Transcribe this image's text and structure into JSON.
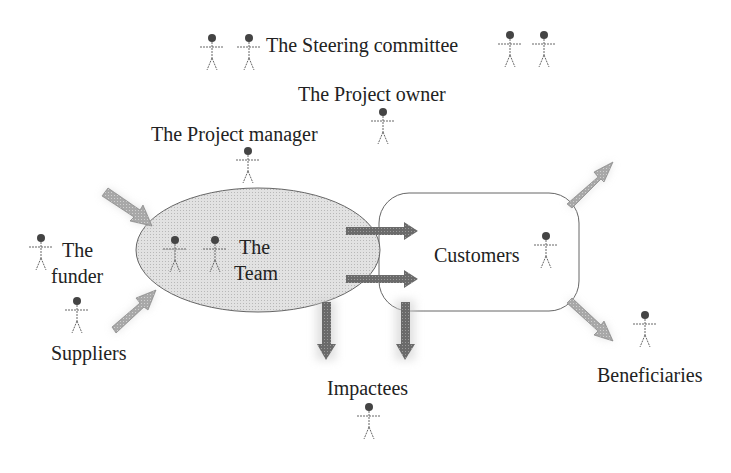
{
  "diagram": {
    "labels": {
      "steering": "The Steering committee",
      "owner": "The Project owner",
      "manager": "The Project manager",
      "team_line1": "The",
      "team_line2": "Team",
      "customers": "Customers",
      "funder_line1": "The",
      "funder_line2": "funder",
      "suppliers": "Suppliers",
      "impactees": "Impactees",
      "beneficiaries": "Beneficiaries"
    },
    "colors": {
      "ellipse_fill": "#d9d9d9",
      "stroke": "#666666",
      "arrow_dark": "#707070",
      "arrow_light": "#b0b0b0",
      "text": "#222222"
    }
  }
}
